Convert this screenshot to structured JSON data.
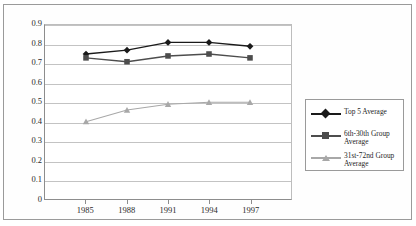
{
  "chart_data": {
    "type": "line",
    "title": "",
    "subtitle": "",
    "xlabel": "",
    "ylabel": "",
    "x": [
      "1985",
      "1988",
      "1991",
      "1994",
      "1997"
    ],
    "categories": [
      "1985",
      "1988",
      "1991",
      "1994",
      "1997"
    ],
    "xlim": [
      1985,
      1997
    ],
    "ylim": [
      0,
      0.9
    ],
    "ytick_labels": [
      "0.9",
      "0.8",
      "0.7",
      "0.6",
      "0.5",
      "0.4",
      "0.3",
      "0.2",
      "0.1",
      "0"
    ],
    "ytick_values": [
      0.9,
      0.8,
      0.7,
      0.6,
      0.5,
      0.4,
      0.3,
      0.2,
      0.1,
      0
    ],
    "grid": "horizontal",
    "legend_position": "right",
    "series": [
      {
        "name": "Top 5 Average",
        "values": [
          0.75,
          0.77,
          0.81,
          0.81,
          0.79
        ],
        "color": "#1a1a1a",
        "marker": "diamond"
      },
      {
        "name": "6th-30th Group Average",
        "values": [
          0.73,
          0.71,
          0.74,
          0.75,
          0.73
        ],
        "color": "#4d4d4d",
        "marker": "square"
      },
      {
        "name": "31st-72nd Group Average",
        "values": [
          0.4,
          0.46,
          0.49,
          0.5,
          0.5
        ],
        "color": "#a8a8a8",
        "marker": "triangle"
      }
    ]
  },
  "legend": {
    "entries": [
      {
        "label": "Top 5 Average"
      },
      {
        "label": "6th-30th Group Average"
      },
      {
        "label": "31st-72nd Group Average"
      }
    ]
  }
}
